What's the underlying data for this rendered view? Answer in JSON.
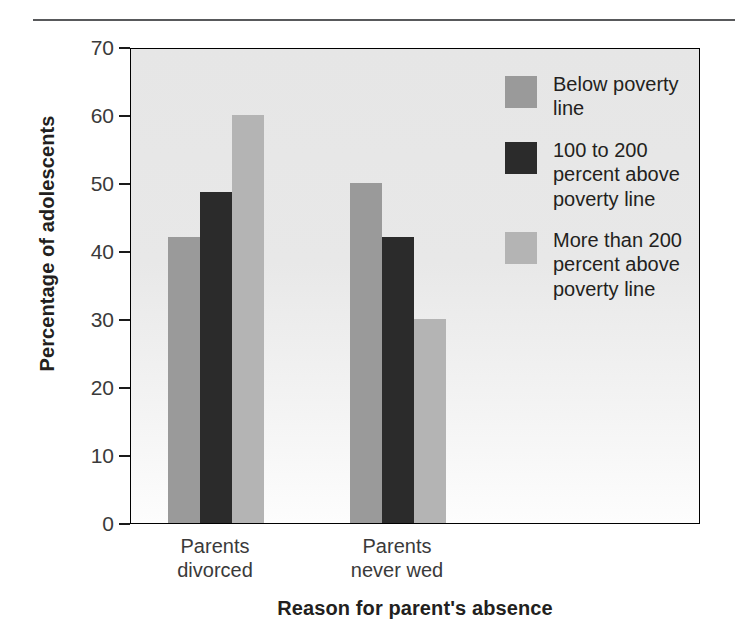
{
  "chart_data": {
    "type": "bar",
    "title": "",
    "subtitle": "",
    "xlabel": "Reason for parent's absence",
    "ylabel": "Percentage of adolescents",
    "categories": [
      "Parents\ndivorced",
      "Parents\nnever wed"
    ],
    "series": [
      {
        "name": "Below poverty\nline",
        "values": [
          42,
          50
        ],
        "color": "#9a9a9a"
      },
      {
        "name": "100 to 200\npercent above\npoverty line",
        "values": [
          48.7,
          42
        ],
        "color": "#2b2b2b"
      },
      {
        "name": "More than 200\npercent above\npoverty line",
        "values": [
          60,
          30
        ],
        "color": "#b4b4b4"
      }
    ],
    "ylim": [
      0,
      70
    ],
    "yticks": [
      0,
      10,
      20,
      30,
      40,
      50,
      60,
      70
    ],
    "ytick_labels": [
      "0",
      "10",
      "20",
      "30",
      "40",
      "50",
      "60",
      "70"
    ],
    "grid": false,
    "legend_position": "inside-top-right",
    "plot_background": "#e8e8e8",
    "axis_color": "#000000"
  },
  "figure": {
    "top_rule_color": "#58595b"
  }
}
